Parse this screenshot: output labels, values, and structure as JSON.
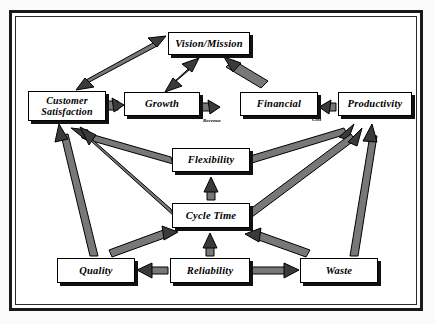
{
  "diagram": {
    "frame": {
      "style": "double-rule-border",
      "color": "#1a1a1a"
    },
    "nodes": [
      {
        "id": "vision",
        "label": "Vision/Mission",
        "x": 168,
        "y": 32,
        "w": 82,
        "h": 23
      },
      {
        "id": "customer",
        "label": "Customer\nSatisfaction",
        "line1": "Customer",
        "line2": "Satisfaction",
        "x": 28,
        "y": 91,
        "w": 78,
        "h": 30
      },
      {
        "id": "growth",
        "label": "Growth",
        "x": 124,
        "y": 92,
        "w": 76,
        "h": 24
      },
      {
        "id": "financial",
        "label": "Financial",
        "x": 240,
        "y": 92,
        "w": 78,
        "h": 24
      },
      {
        "id": "productivity",
        "label": "Productivity",
        "x": 338,
        "y": 92,
        "w": 74,
        "h": 24
      },
      {
        "id": "flexibility",
        "label": "Flexibility",
        "x": 172,
        "y": 148,
        "w": 78,
        "h": 24
      },
      {
        "id": "cycletime",
        "label": "Cycle Time",
        "x": 172,
        "y": 203,
        "w": 78,
        "h": 25
      },
      {
        "id": "quality",
        "label": "Quality",
        "x": 57,
        "y": 258,
        "w": 78,
        "h": 25
      },
      {
        "id": "reliability",
        "label": "Reliability",
        "x": 170,
        "y": 258,
        "w": 80,
        "h": 25
      },
      {
        "id": "waste",
        "label": "Waste",
        "x": 300,
        "y": 258,
        "w": 78,
        "h": 25
      }
    ],
    "edge_labels": [
      {
        "id": "revenue",
        "text": "Revenue",
        "from": "growth",
        "to": "financial"
      },
      {
        "id": "cost",
        "text": "Cost",
        "from": "productivity",
        "to": "financial"
      }
    ],
    "edges": [
      {
        "from": "customer",
        "to": "vision",
        "style": "double-headed"
      },
      {
        "from": "growth",
        "to": "vision",
        "style": "double-headed"
      },
      {
        "from": "financial",
        "to": "vision",
        "style": "single"
      },
      {
        "from": "customer",
        "to": "growth",
        "style": "single"
      },
      {
        "from": "growth",
        "to": "financial",
        "style": "single",
        "label": "Revenue"
      },
      {
        "from": "productivity",
        "to": "financial",
        "style": "single",
        "label": "Cost"
      },
      {
        "from": "flexibility",
        "to": "customer",
        "style": "single"
      },
      {
        "from": "flexibility",
        "to": "productivity",
        "style": "single"
      },
      {
        "from": "cycletime",
        "to": "flexibility",
        "style": "single"
      },
      {
        "from": "cycletime",
        "to": "customer",
        "style": "single"
      },
      {
        "from": "cycletime",
        "to": "productivity",
        "style": "single"
      },
      {
        "from": "quality",
        "to": "customer",
        "style": "single"
      },
      {
        "from": "quality",
        "to": "cycletime",
        "style": "single"
      },
      {
        "from": "reliability",
        "to": "quality",
        "style": "single"
      },
      {
        "from": "reliability",
        "to": "cycletime",
        "style": "single"
      },
      {
        "from": "reliability",
        "to": "waste",
        "style": "single"
      },
      {
        "from": "waste",
        "to": "cycletime",
        "style": "single"
      },
      {
        "from": "waste",
        "to": "productivity",
        "style": "single"
      }
    ],
    "colors": {
      "arrow_fill": "#6f6f6f",
      "arrow_stroke": "#000000",
      "box_fill": "#ffffff",
      "box_border": "#000000",
      "box_shadow": "#111111",
      "text": "#000000"
    }
  }
}
